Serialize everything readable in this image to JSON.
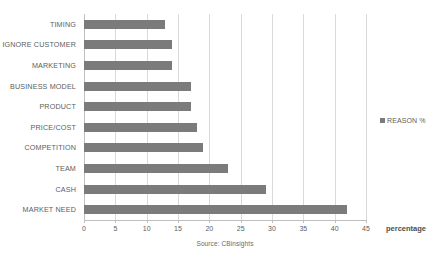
{
  "chart_data": {
    "type": "bar",
    "orientation": "horizontal",
    "title": "",
    "xlabel": "percentage",
    "ylabel": "",
    "xlim": [
      0,
      45
    ],
    "xticks": [
      0,
      5,
      10,
      15,
      20,
      25,
      30,
      35,
      40,
      45
    ],
    "grid": true,
    "legend_position": "right",
    "source_note": "Source: CBinsights",
    "series": [
      {
        "name": "REASON %",
        "color": "#7b7b7b",
        "values": [
          13,
          14,
          14,
          17,
          17,
          18,
          19,
          23,
          29,
          42
        ]
      }
    ],
    "categories": [
      "TIMING",
      "IGNORE CUSTOMER",
      "MARKETING",
      "BUSINESS MODEL",
      "PRODUCT",
      "PRICE/COST",
      "COMPETITION",
      "TEAM",
      "CASH",
      "MARKET NEED"
    ]
  },
  "legend": {
    "entries": [
      {
        "label": "REASON %",
        "color": "#7b7b7b"
      }
    ]
  },
  "axis": {
    "x_title": "percentage",
    "tick_labels": [
      "0",
      "5",
      "10",
      "15",
      "20",
      "25",
      "30",
      "35",
      "40",
      "45"
    ]
  },
  "caption": {
    "source": "Source: CBinsights"
  },
  "colors": {
    "bar": "#7b7b7b",
    "gridline": "#d9d9d9",
    "axis": "#bfbfbf",
    "text": "#5d5d5d",
    "background": "#ffffff"
  }
}
